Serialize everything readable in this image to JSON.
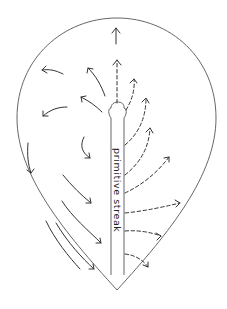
{
  "diagram": {
    "label": "primitive streak",
    "colors": {
      "outline": "#555555",
      "arrows": "#333333",
      "background": "#ffffff"
    },
    "legend_semantics": {
      "solid_arrows": "epiblast cell movement toward streak",
      "dashed_arrows": "cell migration away from streak"
    },
    "solid_arrow_count": 11,
    "dashed_arrow_count": 8
  }
}
